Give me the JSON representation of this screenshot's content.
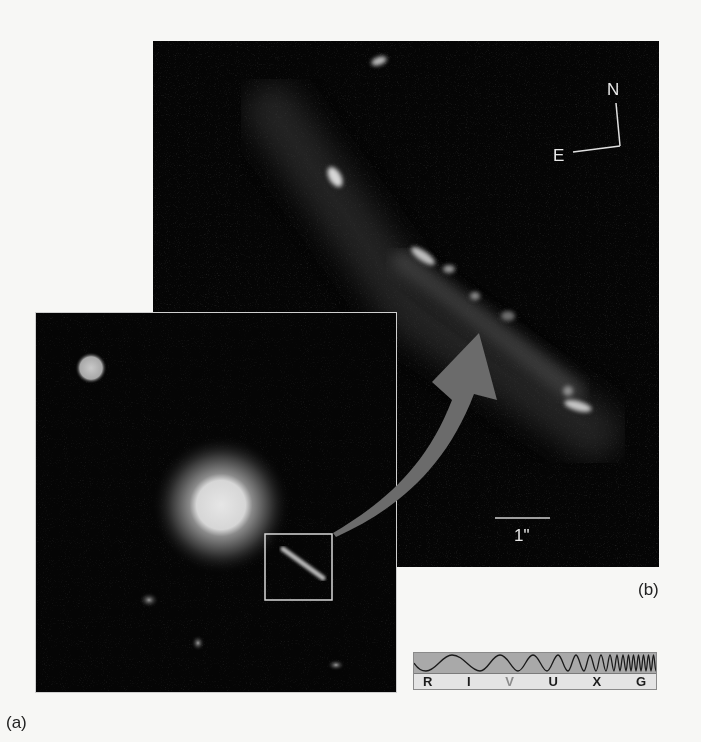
{
  "figure": {
    "panel_a": {
      "label": "(a)",
      "description": "Wide-field view: bright central source with jet inside highlighted inset box"
    },
    "panel_b": {
      "label": "(b)",
      "description": "Enlarged view of the jet region",
      "compass": {
        "north": "N",
        "east": "E"
      },
      "scale_bar": {
        "label": "1\""
      }
    },
    "arrow": {
      "color": "#6b6b6b",
      "meaning": "inset-to-enlargement"
    },
    "spectrum_bar": {
      "bands": [
        "R",
        "I",
        "V",
        "U",
        "X",
        "G"
      ],
      "active_band": "V",
      "wave_color": "#a9a9a9"
    }
  }
}
